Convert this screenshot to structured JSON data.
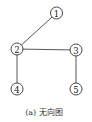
{
  "diagram": {
    "type": "undirected-graph",
    "caption": "(a) 无向图",
    "nodes": [
      {
        "id": "1",
        "label": "1",
        "x": 56.5,
        "y": 13
      },
      {
        "id": "2",
        "label": "2",
        "x": 17,
        "y": 49
      },
      {
        "id": "3",
        "label": "3",
        "x": 76,
        "y": 50
      },
      {
        "id": "4",
        "label": "4",
        "x": 17,
        "y": 89
      },
      {
        "id": "5",
        "label": "5",
        "x": 76,
        "y": 89
      }
    ],
    "edges": [
      {
        "from": "1",
        "to": "2"
      },
      {
        "from": "2",
        "to": "3"
      },
      {
        "from": "2",
        "to": "4"
      },
      {
        "from": "3",
        "to": "5"
      }
    ],
    "node_radius": 6,
    "colors": {
      "stroke": "#333333",
      "edge": "#444444",
      "background": "#ffffff"
    }
  }
}
